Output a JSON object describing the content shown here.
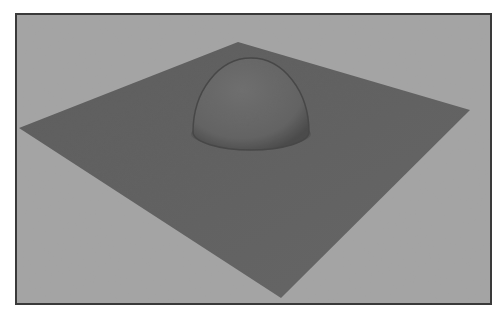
{
  "scene": {
    "description": "3D render of a flat square plane in perspective with a hemisphere bump at its center",
    "frame": {
      "x": 15,
      "y": 13,
      "width": 477,
      "height": 292,
      "border_color": "#3a3a3a"
    },
    "background_color": "#a9a9a9",
    "plane": {
      "color": "#5e5e5e",
      "vertices": [
        [
          19,
          128
        ],
        [
          238,
          42
        ],
        [
          470,
          110
        ],
        [
          281,
          298
        ]
      ]
    },
    "dome": {
      "cx": 251,
      "cy": 108,
      "rx": 58,
      "ry": 44,
      "base_cy": 112,
      "color": "#666666",
      "rim_color": "#3f3f3f"
    }
  }
}
